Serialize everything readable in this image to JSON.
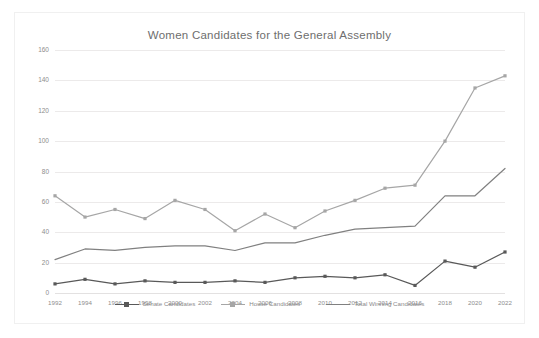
{
  "chart_data": {
    "type": "line",
    "title": "Women Candidates for the General Assembly",
    "xlabel": "",
    "ylabel": "",
    "grid": true,
    "legend_position": "bottom",
    "ylim": [
      0,
      160
    ],
    "yticks": [
      0,
      20,
      40,
      60,
      80,
      100,
      120,
      140,
      160
    ],
    "categories": [
      1992,
      1994,
      1996,
      1998,
      2000,
      2002,
      2004,
      2006,
      2008,
      2010,
      2012,
      2014,
      2016,
      2018,
      2020,
      2022
    ],
    "series": [
      {
        "name": "Senate Candidates",
        "color": "#595959",
        "marker": "square",
        "values": [
          6,
          9,
          6,
          8,
          7,
          7,
          8,
          7,
          10,
          11,
          10,
          12,
          5,
          21,
          17,
          27
        ]
      },
      {
        "name": "House Candidates",
        "color": "#a6a6a6",
        "marker": "square",
        "values": [
          64,
          50,
          55,
          49,
          61,
          55,
          41,
          52,
          43,
          54,
          61,
          69,
          71,
          100,
          135,
          143
        ]
      },
      {
        "name": "Total Winning Candidates",
        "color": "#808080",
        "marker": "none",
        "values": [
          22,
          29,
          28,
          30,
          31,
          31,
          28,
          33,
          33,
          38,
          42,
          43,
          44,
          64,
          64,
          82
        ]
      }
    ]
  },
  "legend": {
    "items": [
      {
        "label": "Senate Candidates"
      },
      {
        "label": "House Candidates"
      },
      {
        "label": "Total Winning Candidates"
      }
    ]
  }
}
